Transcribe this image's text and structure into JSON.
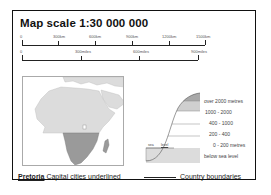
{
  "title": "Map scale 1:30 000 000",
  "scale_km": {
    "labels": [
      "0",
      "300km",
      "600km",
      "900km",
      "1200km",
      "1500km"
    ],
    "positions": [
      22,
      58,
      95,
      132,
      169,
      205
    ]
  },
  "scale_miles": {
    "labels": [
      "0",
      "300miles",
      "600miles",
      "900miles"
    ],
    "positions": [
      22,
      81,
      139,
      198
    ]
  },
  "elevation_legend": {
    "items": [
      {
        "label": "over 2000 metres",
        "color": "#a8a8a8"
      },
      {
        "label": "1000 - 2000",
        "color": "#cfcfcf"
      },
      {
        "label": "400 - 1000",
        "color": "#ffffff"
      },
      {
        "label": "200 - 400",
        "color": "#ffffff"
      },
      {
        "label": "0 - 200 metres",
        "color": "#ffffff"
      },
      {
        "label": "below sea level",
        "color": "#d9d9d9"
      }
    ],
    "sea_label": "sea",
    "level_label": "level"
  },
  "footer": {
    "capital_example": "Pretoria",
    "capital_text": "Capital cities underlined",
    "boundary_text": "Country boundaries"
  },
  "colors": {
    "land": "#dcdcdc",
    "highlight_region": "#9a9a9a",
    "frame": "#111111"
  }
}
